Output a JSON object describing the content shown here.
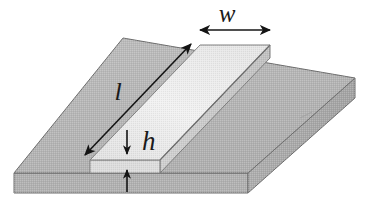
{
  "figure": {
    "type": "technical-diagram",
    "background_color": "#ffffff"
  },
  "labels": {
    "width": {
      "text": "w",
      "meaning": "strip width",
      "style": "italic-serif",
      "color": "#1a1a1a"
    },
    "length": {
      "text": "l",
      "meaning": "strip length",
      "style": "italic-serif",
      "color": "#1a1a1a"
    },
    "height": {
      "text": "h",
      "meaning": "strip height / thickness",
      "style": "italic-serif",
      "color": "#1a1a1a"
    }
  },
  "annotations": {
    "width_arrow": {
      "name": "double-headed-horizontal-arrow",
      "heads": "both"
    },
    "length_arrow": {
      "name": "double-headed-diagonal-arrow",
      "heads": "both"
    },
    "height_arrow_upper": {
      "name": "single-headed-down-arrow",
      "heads": "one"
    },
    "height_arrow_lower": {
      "name": "single-headed-up-arrow",
      "heads": "one"
    }
  },
  "geometry": {
    "substrate": {
      "name": "dielectric-substrate-slab",
      "top_face_color": "#b5b5b5",
      "front_face_color": "#b0b0b0",
      "right_face_color": "#a8a8a8",
      "outline_color": "#6a6a6a",
      "top_face_points": "14,173 123,38 355,78 248,173",
      "front_face_points": "14,173 248,173 248,193 14,193",
      "right_face_points": "248,173 355,78 355,98 248,193"
    },
    "strip": {
      "name": "conductor-strip",
      "top_face_color": "#ededed",
      "front_face_color": "#dcdcdc",
      "right_face_color": "#c9c9c9",
      "outline_color": "#7a7a7a",
      "top_face_points": "90,160 200,45 270,45 160,160",
      "front_face_points": "90,160 160,160 160,173 90,173",
      "right_face_points": "160,160 270,45 270,58 160,173"
    }
  }
}
